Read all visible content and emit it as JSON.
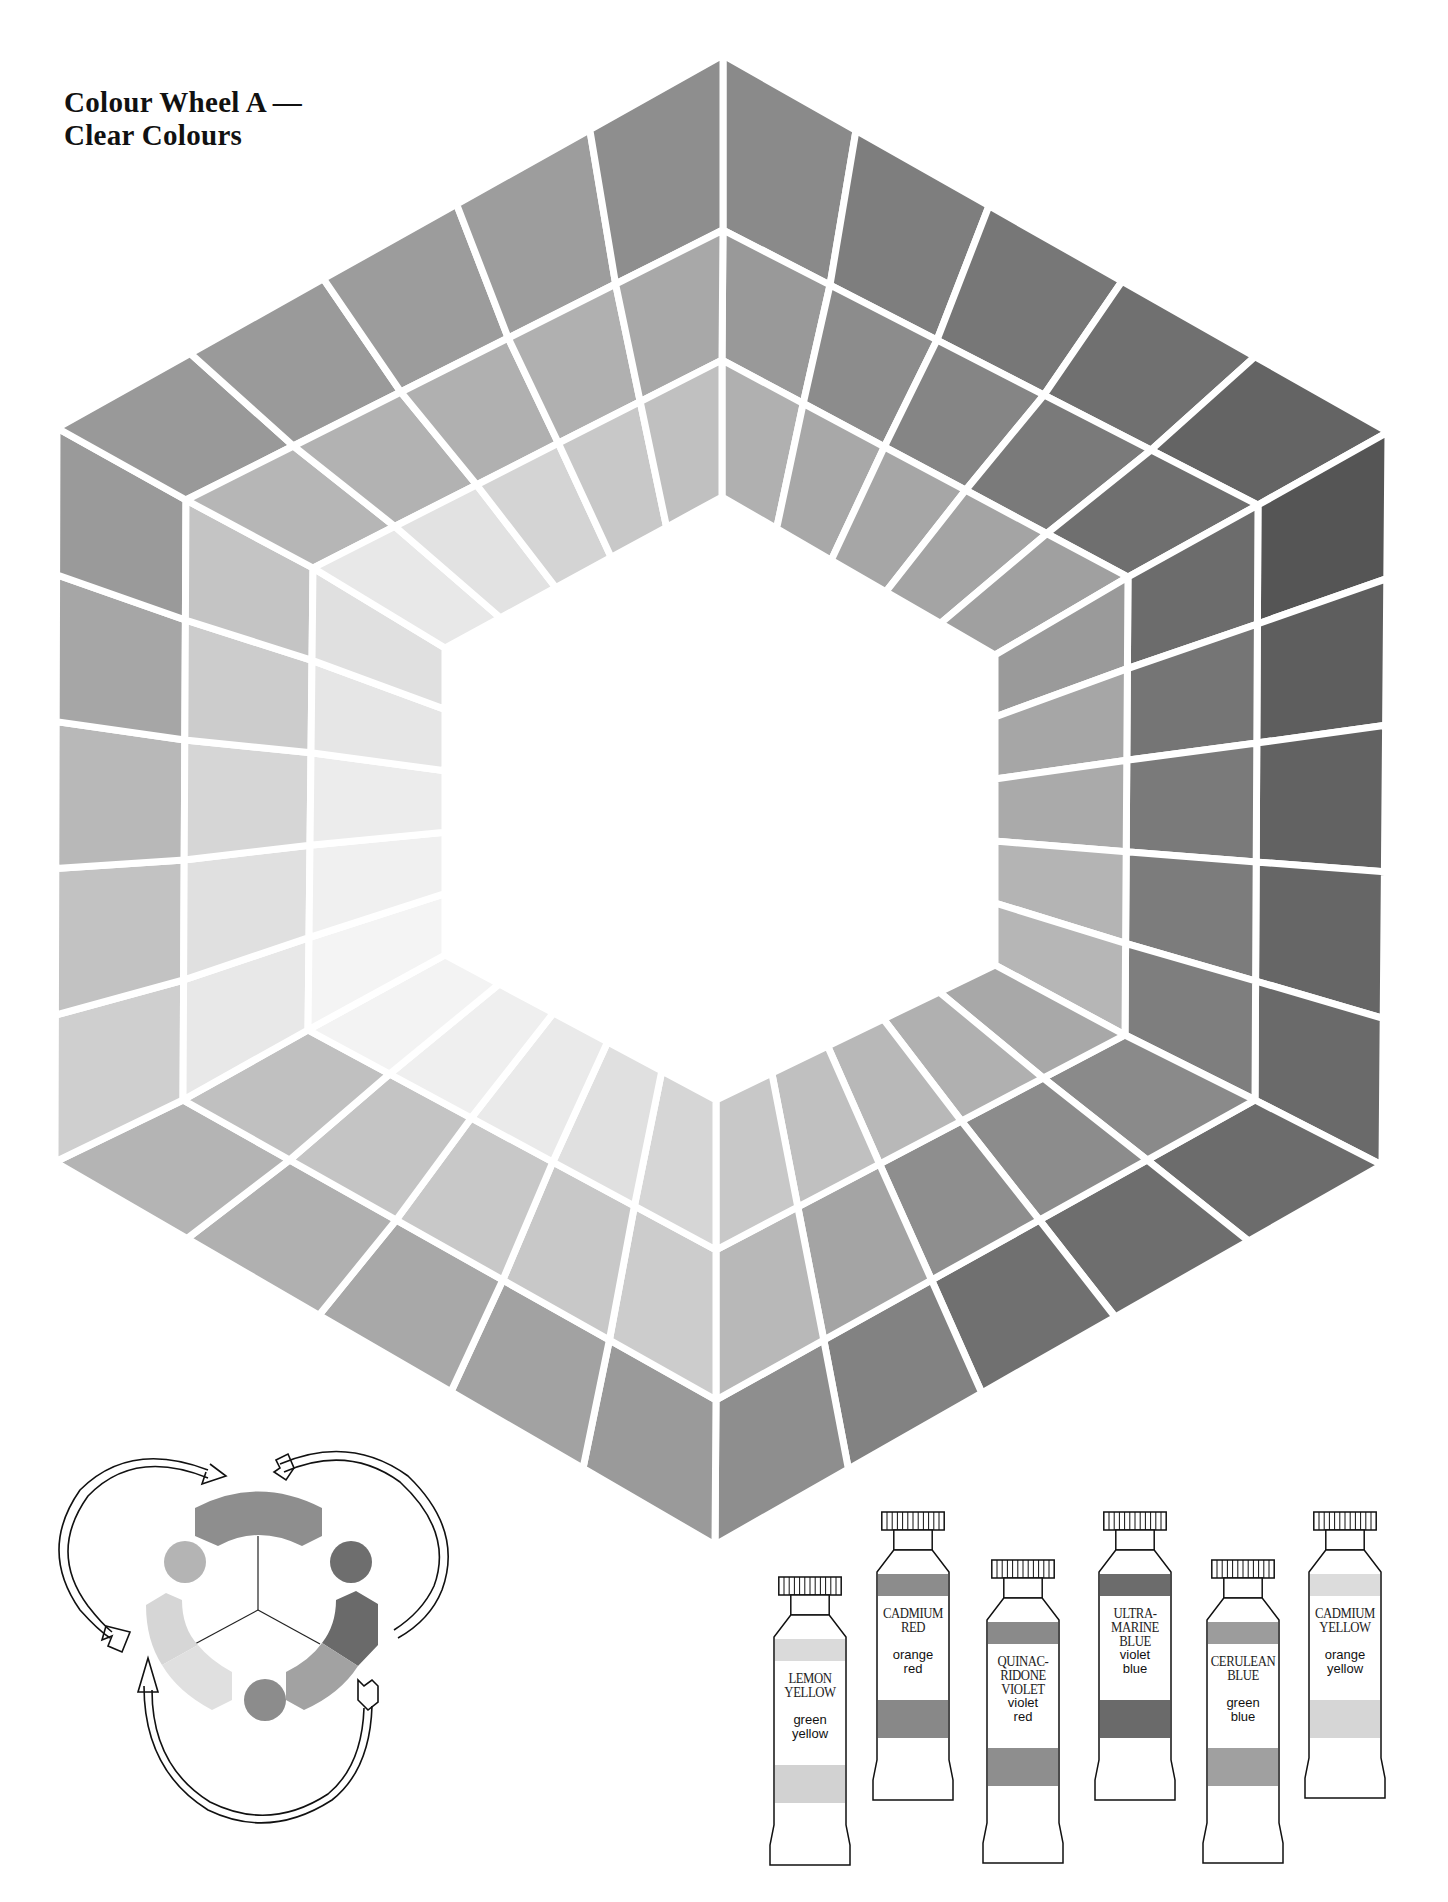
{
  "title": {
    "line1": "Colour Wheel A —",
    "line2": "Clear Colours"
  },
  "wheel": {
    "shape": "hexagon",
    "rings": 3,
    "cells_per_side": 5,
    "gap_color": "#ffffff",
    "boundaries": [
      [
        [
          723,
          55
        ],
        [
          1388,
          432
        ],
        [
          1382,
          1165
        ],
        [
          715,
          1545
        ],
        [
          55,
          1162
        ],
        [
          57,
          428
        ]
      ],
      [
        [
          723,
          230
        ],
        [
          1258,
          505
        ],
        [
          1255,
          1100
        ],
        [
          716,
          1400
        ],
        [
          183,
          1100
        ],
        [
          186,
          500
        ]
      ],
      [
        [
          722,
          360
        ],
        [
          1128,
          577
        ],
        [
          1125,
          1035
        ],
        [
          716,
          1250
        ],
        [
          308,
          1030
        ],
        [
          313,
          568
        ]
      ],
      [
        [
          722,
          497
        ],
        [
          995,
          655
        ],
        [
          995,
          965
        ],
        [
          716,
          1100
        ],
        [
          445,
          955
        ],
        [
          445,
          648
        ]
      ]
    ],
    "tones": {
      "outer": [
        [
          "#8a8a8a",
          "#7e7e7e",
          "#777777",
          "#707070",
          "#646464"
        ],
        [
          "#555555",
          "#5e5e5e",
          "#626262",
          "#666666",
          "#6a6a6a"
        ],
        [
          "#6c6c6c",
          "#6e6e6e",
          "#707070",
          "#828282",
          "#8e8e8e"
        ],
        [
          "#9a9a9a",
          "#a2a2a2",
          "#a8a8a8",
          "#b0b0b0",
          "#b4b4b4"
        ],
        [
          "#cfcfcf",
          "#c2c2c2",
          "#b8b8b8",
          "#a6a6a6",
          "#9a9a9a"
        ],
        [
          "#999999",
          "#9a9a9a",
          "#9c9c9c",
          "#9d9d9d",
          "#8e8e8e"
        ]
      ],
      "middle": [
        [
          "#999999",
          "#8c8c8c",
          "#858585",
          "#7a7a7a",
          "#6f6f6f"
        ],
        [
          "#6c6c6c",
          "#757575",
          "#7a7a7a",
          "#7c7c7c",
          "#7e7e7e"
        ],
        [
          "#8a8a8a",
          "#8c8c8c",
          "#8e8e8e",
          "#a4a4a4",
          "#b8b8b8"
        ],
        [
          "#cccccc",
          "#c8c8c8",
          "#c8c8c8",
          "#c4c4c4",
          "#c0c0c0"
        ],
        [
          "#e8e8e8",
          "#e0e0e0",
          "#d6d6d6",
          "#cccccc",
          "#c4c4c4"
        ],
        [
          "#b6b6b6",
          "#b2b2b2",
          "#b0b0b0",
          "#b0b0b0",
          "#a8a8a8"
        ]
      ],
      "inner": [
        [
          "#b0b0b0",
          "#a8a8a8",
          "#a6a6a6",
          "#a4a4a4",
          "#a0a0a0"
        ],
        [
          "#9a9a9a",
          "#a6a6a6",
          "#aaaaaa",
          "#b4b4b4",
          "#b6b6b6"
        ],
        [
          "#a8a8a8",
          "#b0b0b0",
          "#b8b8b8",
          "#c0c0c0",
          "#c8c8c8"
        ],
        [
          "#d6d6d6",
          "#e0e0e0",
          "#eaeaea",
          "#efefef",
          "#f3f3f3"
        ],
        [
          "#f4f4f4",
          "#f0f0f0",
          "#ececec",
          "#e6e6e6",
          "#e0e0e0"
        ],
        [
          "#e8e8e8",
          "#e2e2e2",
          "#d4d4d4",
          "#c8c8c8",
          "#c0c0c0"
        ]
      ]
    }
  },
  "cycle_diagram": {
    "description": "three-primary colour cycle with arrows",
    "arc_colors": {
      "top": "#8e8e8e",
      "right_dark": "#6a6a6a",
      "right_light": "#a2a2a2",
      "left_top": "#d6d6d6",
      "left_bottom": "#e0e0e0"
    },
    "dot_colors": {
      "upper_left": "#b4b4b4",
      "upper_right": "#6e6e6e",
      "bottom": "#8c8c8c"
    },
    "line_color": "#222222"
  },
  "tubes": [
    {
      "name": [
        "LEMON",
        "YELLOW"
      ],
      "desc": [
        "green",
        "yellow"
      ],
      "band_top": "#dadada",
      "band_bottom": "#d2d2d2"
    },
    {
      "name": [
        "CADMIUM",
        "RED"
      ],
      "desc": [
        "orange",
        "red"
      ],
      "band_top": "#8c8c8c",
      "band_bottom": "#888888"
    },
    {
      "name": [
        "QUINAC-",
        "RIDONE",
        "VIOLET"
      ],
      "desc": [
        "violet",
        "red"
      ],
      "band_top": "#8a8a8a",
      "band_bottom": "#8e8e8e"
    },
    {
      "name": [
        "ULTRA-",
        "MARINE",
        "BLUE"
      ],
      "desc": [
        "violet",
        "blue"
      ],
      "band_top": "#6c6c6c",
      "band_bottom": "#6a6a6a"
    },
    {
      "name": [
        "CERULEAN",
        "BLUE"
      ],
      "desc": [
        "green",
        "blue"
      ],
      "band_top": "#9c9c9c",
      "band_bottom": "#a0a0a0"
    },
    {
      "name": [
        "CADMIUM",
        "YELLOW"
      ],
      "desc": [
        "orange",
        "yellow"
      ],
      "band_top": "#dcdcdc",
      "band_bottom": "#d6d6d6"
    }
  ]
}
